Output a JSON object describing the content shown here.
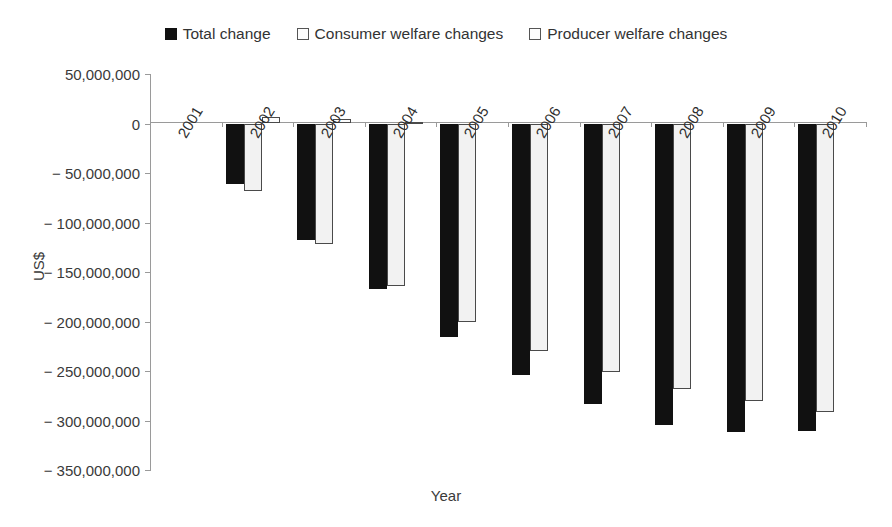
{
  "chart_data": {
    "type": "bar",
    "title": "",
    "xlabel": "Year",
    "ylabel": "US$",
    "ylim": [
      -350000000,
      50000000
    ],
    "ytick_values": [
      50000000,
      0,
      -50000000,
      -100000000,
      -150000000,
      -200000000,
      -250000000,
      -300000000,
      -350000000
    ],
    "ytick_labels": [
      "50,000,000",
      "0",
      "− 50,000,000",
      "− 100,000,000",
      "− 150,000,000",
      "− 200,000,000",
      "− 250,000,000",
      "− 300,000,000",
      "− 350,000,000"
    ],
    "grid": false,
    "legend_position": "top-center",
    "categories": [
      "2001",
      "2002",
      "2003",
      "2004",
      "2005",
      "2006",
      "2007",
      "2008",
      "2009",
      "2010"
    ],
    "series": [
      {
        "name": "Total change",
        "style": "filled-black",
        "color": "#111111",
        "values": [
          0,
          -61000000,
          -118000000,
          -167000000,
          -216000000,
          -254000000,
          -283000000,
          -305000000,
          -312000000,
          -311000000
        ]
      },
      {
        "name": "Consumer welfare changes",
        "style": "open-light",
        "color": "#f2f2f2",
        "values": [
          0,
          -68000000,
          -122000000,
          -164000000,
          -201000000,
          -230000000,
          -251000000,
          -268000000,
          -280000000,
          -291000000
        ]
      },
      {
        "name": "Producer welfare changes",
        "style": "open-white",
        "color": "#fdfdfd",
        "values": [
          0,
          7000000,
          5000000,
          1500000,
          0,
          0,
          0,
          0,
          0,
          0
        ]
      }
    ]
  },
  "legend": {
    "items": [
      {
        "label": "Total change",
        "swatch": "filled-square-icon"
      },
      {
        "label": "Consumer welfare changes",
        "swatch": "open-square-icon"
      },
      {
        "label": "Producer welfare changes",
        "swatch": "open-square-icon"
      }
    ]
  },
  "axes": {
    "y_title": "US$",
    "x_title": "Year"
  }
}
